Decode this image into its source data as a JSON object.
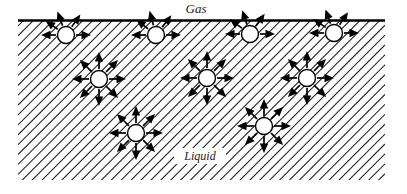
{
  "figure": {
    "width": 407,
    "height": 194,
    "background_color": "#ffffff",
    "line_color": "#000000"
  },
  "labels": {
    "gas": "Gas",
    "liquid": "Liquid"
  },
  "regions": {
    "gas": {
      "name": "Gas",
      "fill": "none",
      "x": 18,
      "y": 0,
      "width": 367,
      "height": 20
    },
    "liquid": {
      "name": "Liquid",
      "fill": "diagonal-hatch",
      "hatch_angle_deg": 45,
      "hatch_spacing_px": 7,
      "hatch_color": "#1c1c1c",
      "x": 18,
      "y": 20,
      "width": 367,
      "height": 160
    }
  },
  "interface": {
    "name": "liquid-gas-interface",
    "x1": 18,
    "y1": 20.5,
    "x2": 385,
    "y2": 20.5,
    "stroke_width": 2.6,
    "color": "#000000"
  },
  "label_positions": {
    "gas": {
      "x": 196,
      "y": 13
    },
    "liquid": {
      "x": 200,
      "y": 160
    }
  },
  "legend_note": {
    "surface": "Molecules at the surface experience unbalanced attractive forces directed sideways and into the liquid.",
    "interior": "Molecules in the bulk experience attractive forces equally in all directions."
  },
  "molecules": [
    {
      "id": "surface-molecule-1",
      "type": "surface",
      "cx": 66,
      "cy": 35,
      "r": 8.5,
      "arrow_count": 5,
      "arrow_length": 25,
      "arrow_angles_deg": [
        180,
        0,
        215,
        250,
        305
      ]
    },
    {
      "id": "surface-molecule-2",
      "type": "surface",
      "cx": 156,
      "cy": 35,
      "r": 8.5,
      "arrow_count": 5,
      "arrow_length": 25,
      "arrow_angles_deg": [
        180,
        0,
        218,
        255,
        308
      ]
    },
    {
      "id": "surface-molecule-3",
      "type": "surface",
      "cx": 250,
      "cy": 34,
      "r": 8.5,
      "arrow_count": 5,
      "arrow_length": 25,
      "arrow_angles_deg": [
        180,
        0,
        216,
        252,
        306
      ]
    },
    {
      "id": "surface-molecule-4",
      "type": "surface",
      "cx": 334,
      "cy": 33,
      "r": 8.5,
      "arrow_count": 5,
      "arrow_length": 25,
      "arrow_angles_deg": [
        180,
        0,
        214,
        250,
        304
      ]
    },
    {
      "id": "interior-molecule-1",
      "type": "interior",
      "cx": 99,
      "cy": 79,
      "r": 8.5,
      "arrow_count": 8,
      "arrow_length": 27,
      "arrow_angles_deg": [
        0,
        45,
        90,
        135,
        180,
        225,
        270,
        315
      ]
    },
    {
      "id": "interior-molecule-2",
      "type": "interior",
      "cx": 207,
      "cy": 78,
      "r": 8.5,
      "arrow_count": 8,
      "arrow_length": 27,
      "arrow_angles_deg": [
        0,
        45,
        90,
        135,
        180,
        225,
        270,
        315
      ]
    },
    {
      "id": "interior-molecule-3",
      "type": "interior",
      "cx": 307,
      "cy": 78,
      "r": 8.5,
      "arrow_count": 8,
      "arrow_length": 27,
      "arrow_angles_deg": [
        0,
        45,
        90,
        135,
        180,
        225,
        270,
        315
      ]
    },
    {
      "id": "interior-molecule-4",
      "type": "interior",
      "cx": 136,
      "cy": 133,
      "r": 8.5,
      "arrow_count": 8,
      "arrow_length": 27,
      "arrow_angles_deg": [
        0,
        45,
        90,
        135,
        180,
        225,
        270,
        315
      ]
    },
    {
      "id": "interior-molecule-5",
      "type": "interior",
      "cx": 264,
      "cy": 126,
      "r": 8.5,
      "arrow_count": 8,
      "arrow_length": 27,
      "arrow_angles_deg": [
        0,
        45,
        90,
        135,
        180,
        225,
        270,
        315
      ]
    }
  ]
}
